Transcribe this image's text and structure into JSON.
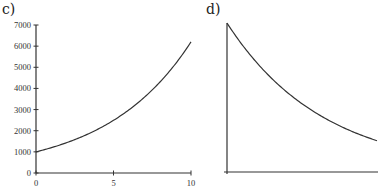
{
  "panels": {
    "c": {
      "label": "c)"
    },
    "d": {
      "label": "d)"
    }
  },
  "chart_data": [
    {
      "type": "line",
      "panel": "c)",
      "title": "",
      "xlabel": "",
      "ylabel": "",
      "xlim": [
        0,
        10
      ],
      "ylim": [
        0,
        7000
      ],
      "x_ticks": [
        0,
        5,
        10
      ],
      "y_ticks": [
        0,
        1000,
        2000,
        3000,
        4000,
        5000,
        6000,
        7000
      ],
      "x_tick_labels": [
        "0",
        "5",
        "10"
      ],
      "y_tick_labels": [
        "0",
        "1000",
        "2000",
        "3000",
        "4000",
        "5000",
        "6000",
        "7000"
      ],
      "grid": false,
      "series": [
        {
          "name": "exponential growth",
          "x": [
            0,
            1,
            2,
            3,
            4,
            5,
            6,
            7,
            8,
            9,
            10
          ],
          "values": [
            1000,
            1200,
            1440,
            1730,
            2070,
            2490,
            2990,
            3590,
            4300,
            5160,
            6200
          ]
        }
      ]
    },
    {
      "type": "line",
      "panel": "d)",
      "title": "",
      "xlabel": "",
      "ylabel": "",
      "x_ticks": [],
      "y_ticks": [],
      "grid": false,
      "series": [
        {
          "name": "exponential decay",
          "x": [
            0,
            1,
            2,
            3,
            4,
            5,
            6,
            7,
            8,
            9,
            10
          ],
          "values": [
            1.0,
            0.84,
            0.71,
            0.6,
            0.51,
            0.43,
            0.36,
            0.3,
            0.26,
            0.22,
            0.21
          ]
        }
      ]
    }
  ]
}
